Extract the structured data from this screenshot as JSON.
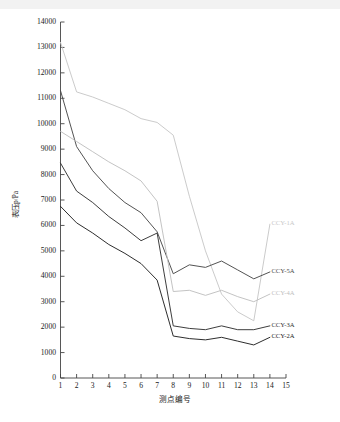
{
  "chart_data": {
    "type": "line",
    "title": "",
    "xlabel": "测点编号",
    "ylabel": "表压p/Pa",
    "xlim": [
      1,
      15
    ],
    "ylim": [
      0,
      14000
    ],
    "xticks": [
      1,
      2,
      3,
      4,
      5,
      6,
      7,
      8,
      9,
      10,
      11,
      12,
      13,
      14,
      15
    ],
    "yticks": [
      0,
      1000,
      2000,
      3000,
      4000,
      5000,
      6000,
      7000,
      8000,
      9000,
      10000,
      11000,
      12000,
      13000,
      14000
    ],
    "grid": false,
    "legend_position": "right-inline",
    "x": [
      1,
      2,
      3,
      4,
      5,
      6,
      7,
      8,
      9,
      10,
      11,
      12,
      13
    ],
    "series": [
      {
        "name": "CCY-1A",
        "color": "#c8c8c8",
        "label_x": 14.0,
        "label_y": 6050,
        "values": [
          13200,
          11250,
          11050,
          10800,
          10550,
          10200,
          10050,
          9550,
          7150,
          5000,
          3300,
          2600,
          2250
        ]
      },
      {
        "name": "CCY-5A",
        "color": "#4a4a4a",
        "label_x": 14.0,
        "label_y": 4170,
        "values": [
          11300,
          9100,
          8150,
          7450,
          6900,
          6500,
          5750,
          4100,
          4450,
          4350,
          4600,
          4250,
          3900
        ]
      },
      {
        "name": "CCY-4A",
        "color": "#c0c0c0",
        "label_x": 14.0,
        "label_y": 3300,
        "values": [
          9700,
          9300,
          8900,
          8500,
          8150,
          7750,
          6950,
          3400,
          3450,
          3250,
          3450,
          3200,
          3000
        ]
      },
      {
        "name": "CCY-3A",
        "color": "#333333",
        "label_x": 14.0,
        "label_y": 2050,
        "values": [
          8450,
          7350,
          6900,
          6350,
          5900,
          5400,
          5700,
          2050,
          1950,
          1900,
          2050,
          1900,
          1900
        ]
      },
      {
        "name": "CCY-2A",
        "color": "#222222",
        "label_x": 14.0,
        "label_y": 1600,
        "values": [
          6750,
          6100,
          5700,
          5250,
          4900,
          4500,
          3850,
          1650,
          1550,
          1500,
          1600,
          1450,
          1300
        ]
      }
    ]
  },
  "axes": {
    "y_title": "表压p/Pa",
    "x_title": "测点编号",
    "y_tick_labels": [
      "0",
      "1000",
      "2000",
      "3000",
      "4000",
      "5000",
      "6000",
      "7000",
      "8000",
      "9000",
      "10000",
      "11000",
      "12000",
      "13000",
      "14000"
    ],
    "x_tick_labels": [
      "1",
      "2",
      "3",
      "4",
      "5",
      "6",
      "7",
      "8",
      "9",
      "10",
      "11",
      "12",
      "13",
      "14",
      "15"
    ]
  }
}
